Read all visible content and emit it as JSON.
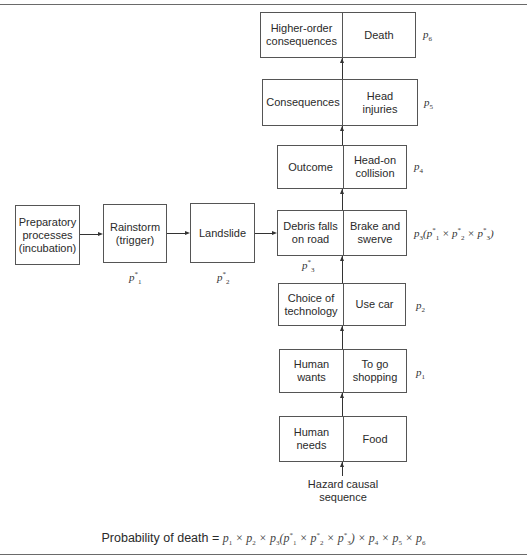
{
  "diagram": {
    "chain_boxes": [
      {
        "id": "higher-order",
        "left": "Higher-order consequences",
        "right": "Death",
        "p_label": "p",
        "p_sub": "6"
      },
      {
        "id": "consequences",
        "left": "Consequences",
        "right": "Head injuries",
        "p_label": "p",
        "p_sub": "5"
      },
      {
        "id": "outcome",
        "left": "Outcome",
        "right": "Head-on collision",
        "p_label": "p",
        "p_sub": "4"
      },
      {
        "id": "debris",
        "left": "Debris falls on road",
        "right": "Brake and swerve",
        "p_label": "p",
        "p_sub": "3",
        "p_extra": "(p1* × p2* × p3*)"
      },
      {
        "id": "technology",
        "left": "Choice of technology",
        "right": "Use car",
        "p_label": "p",
        "p_sub": "2"
      },
      {
        "id": "wants",
        "left": "Human wants",
        "right": "To go shopping",
        "p_label": "p",
        "p_sub": "1"
      },
      {
        "id": "needs",
        "left": "Human needs",
        "right": "Food"
      }
    ],
    "hazard_boxes": [
      {
        "id": "preparatory",
        "text": "Preparatory processes (incubation)"
      },
      {
        "id": "rainstorm",
        "text": "Rainstorm (trigger)",
        "p_label": "p",
        "p_sub": "1",
        "star": "*"
      },
      {
        "id": "landslide",
        "text": "Landslide",
        "p_label": "p",
        "p_sub": "2",
        "star": "*"
      }
    ],
    "debris_star_label": {
      "p_label": "p",
      "p_sub": "3",
      "star": "*"
    },
    "base_label": "Hazard causal sequence",
    "formula": {
      "lhs": "Probability of death",
      "rhs": "p1 × p2 × p3(p1* × p2* × p3*) × p4 × p5 × p6"
    }
  }
}
